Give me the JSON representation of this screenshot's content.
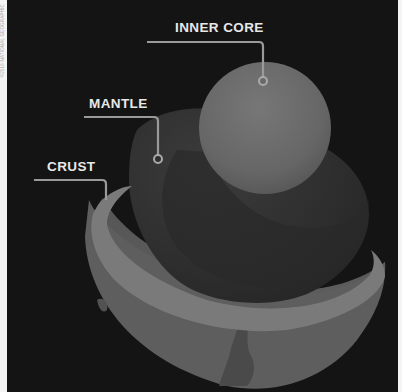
{
  "credit": "©2016 NATIONAL GEOGRAPHIC",
  "colors": {
    "background": "#141414",
    "inner_core": "#6a6a6a",
    "mantle": "#303030",
    "crust_shell": "#5c5c5c",
    "crust_rim": "#7a7a7a",
    "leader_line": "#9a9a9a",
    "label_text": "#e8e8e8"
  },
  "labels": {
    "inner_core": "INNER CORE",
    "mantle": "MANTLE",
    "crust": "CRUST"
  }
}
